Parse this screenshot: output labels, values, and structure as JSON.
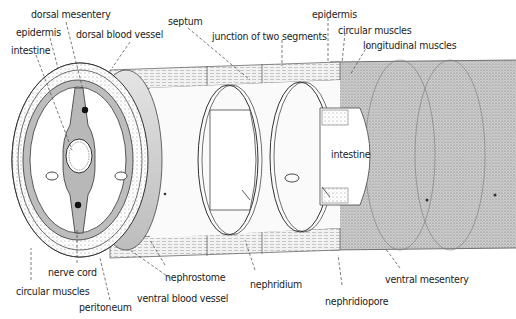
{
  "diagram": {
    "labels": {
      "dorsal_mesentery": "dorsal mesentery",
      "epidermis_left": "epidermis",
      "intestine_left": "intestine",
      "dorsal_blood_vessel": "dorsal blood vessel",
      "septum": "septum",
      "junction": "junction of two segments",
      "epidermis_right": "epidermis",
      "circular_muscles_top": "circular muscles",
      "longitudinal_muscles": "longitudinal muscles",
      "intestine_center": "intestine",
      "nerve_cord": "nerve cord",
      "circular_muscles_bottom": "circular muscles",
      "peritoneum": "peritoneum",
      "nephrostome": "nephrostome",
      "ventral_blood_vessel": "ventral blood vessel",
      "nephridium": "nephridium",
      "nephridiopore": "nephridiopore",
      "ventral_mesentery": "ventral mesentery"
    }
  }
}
